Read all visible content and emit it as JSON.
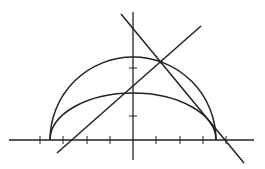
{
  "diagram": {
    "stroke_color": "#222222",
    "background": "#ffffff",
    "axes": {
      "origin": [
        133,
        140
      ],
      "x_axis": {
        "x1": 9,
        "x2": 254,
        "y": 140
      },
      "y_axis": {
        "x": 133,
        "y1": 12,
        "y2": 160
      },
      "x_ticks": [
        40,
        63,
        87,
        110,
        156,
        180,
        203,
        226
      ],
      "y_ticks": [
        116,
        68
      ],
      "tick_half_length": 4
    },
    "semicircle": {
      "cx": 133,
      "cy": 140,
      "rx": 83,
      "ry": 83
    },
    "half_ellipse": {
      "cx": 133,
      "cy": 140,
      "rx": 83,
      "ry": 47
    },
    "lines": [
      {
        "name": "increasing-line",
        "x1": 57,
        "y1": 153,
        "x2": 201,
        "y2": 26
      },
      {
        "name": "decreasing-line",
        "x1": 121,
        "y1": 14,
        "x2": 244,
        "y2": 163
      }
    ],
    "intersection_point": [
      161,
      62
    ]
  }
}
